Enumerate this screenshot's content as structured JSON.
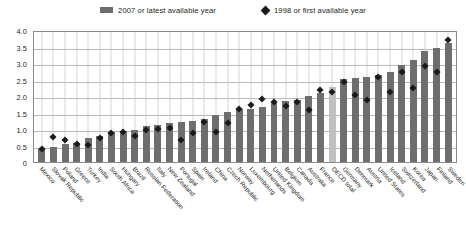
{
  "legend": {
    "items": [
      {
        "label": "2007 or latest available year",
        "marker": "square-swatch",
        "color": "#6e6e6e"
      },
      {
        "label": "1998 or first available year",
        "marker": "diamond-marker",
        "color": "#1a1a1a"
      }
    ]
  },
  "axis": {
    "y_ticks": [
      "4.0",
      "3.5",
      "3.0",
      "2.5",
      "2.0",
      "1.5",
      "1.0",
      "0.5",
      "0"
    ]
  },
  "colors": {
    "bar": "#6e6e6e",
    "bar_highlight": "#c0c0c0",
    "marker": "#1a1a1a",
    "grid": "#b9b9b9",
    "frame": "#8c8c8c"
  },
  "chart_data": {
    "type": "bar",
    "title": "",
    "subtitle": "",
    "xlabel": "",
    "ylabel": "",
    "ylim": [
      0,
      4.0
    ],
    "ytick_step": 0.5,
    "grid": true,
    "legend_position": "top-center",
    "highlight_category": "OECD total",
    "categories": [
      "Mexico",
      "Slovak Republic",
      "Poland",
      "Greece",
      "Turkey",
      "India",
      "South Africa",
      "Hungary",
      "Brazil",
      "Russian Federation",
      "Italy",
      "New Zealand",
      "Portugal",
      "Spain",
      "Ireland",
      "China",
      "Czech Republic",
      "Norway",
      "Luxembourg",
      "Netherlands",
      "United Kingdom",
      "Belgium",
      "Canada",
      "Australia",
      "France",
      "OECD total",
      "Germany",
      "Denmark",
      "Austria",
      "United States",
      "Iceland",
      "Switzerland",
      "Korea",
      "Japan",
      "Finland",
      "Sweden"
    ],
    "series": [
      {
        "name": "2007 or latest available year",
        "marker": "bar",
        "values": [
          0.4,
          0.46,
          0.56,
          0.58,
          0.72,
          0.8,
          0.92,
          0.95,
          0.98,
          1.08,
          1.12,
          1.18,
          1.2,
          1.25,
          1.3,
          1.42,
          1.52,
          1.62,
          1.62,
          1.67,
          1.8,
          1.85,
          1.88,
          2.0,
          2.1,
          2.28,
          2.52,
          2.55,
          2.58,
          2.65,
          2.72,
          2.95,
          3.1,
          3.35,
          3.45,
          3.62
        ]
      },
      {
        "name": "1998 or first available year",
        "marker": "diamond",
        "values": [
          0.38,
          0.76,
          0.66,
          0.56,
          0.52,
          0.72,
          0.88,
          0.9,
          0.78,
          0.98,
          1.0,
          1.02,
          0.68,
          0.88,
          1.2,
          0.92,
          1.18,
          1.62,
          1.72,
          1.92,
          1.82,
          1.7,
          1.82,
          1.58,
          2.18,
          2.12,
          2.42,
          2.02,
          1.88,
          2.58,
          2.12,
          2.72,
          2.25,
          2.9,
          2.72,
          3.7
        ]
      }
    ]
  }
}
